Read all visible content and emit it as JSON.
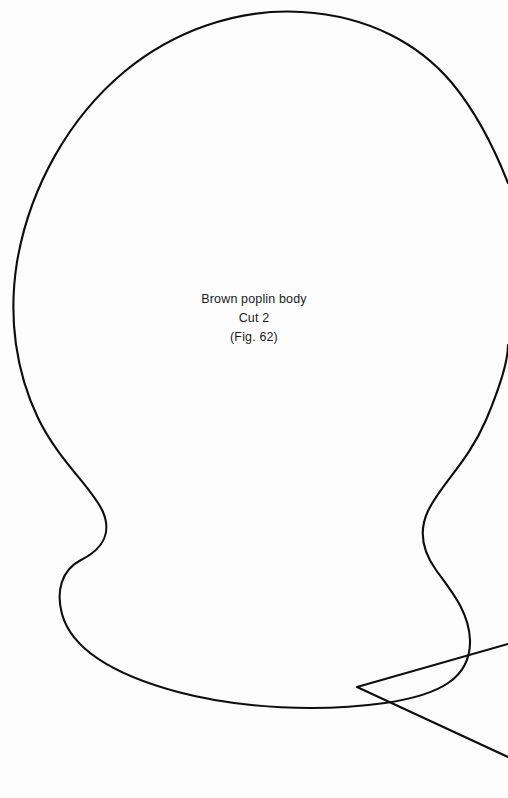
{
  "page": {
    "background_color": "#fdfdfd",
    "width": 508,
    "height": 798,
    "document_type": "sewing pattern template sheet"
  },
  "label": {
    "line1": "Brown poplin body",
    "line2": "Cut 2",
    "line3": "(Fig. 62)",
    "text_color": "#1a1a1a",
    "align": "center"
  },
  "shapes": {
    "stroke_color": "#0d0d0d",
    "stroke_width": 2.1,
    "fill": "none",
    "body_piece": {
      "name": "brown-poplin-body-outline",
      "description": "Large rounded dome-topped body pattern piece with narrowed waist and wide rounded base; right portion extends past the right page edge.",
      "path": "M 508 183 C 495 150 476 112 452 83 C 420 45 370 16 302 12 C 236 8 172 32 124 72 C 70 117 30 186 17 262 C 8 318 16 372 38 418 C 60 463 92 487 103 512 C 111 531 105 548 81 560 C 61 570 56 592 62 614 C 72 650 115 675 178 692 C 242 709 320 712 385 703 C 440 695 471 678 470 640 C 469 612 452 592 436 570 C 421 549 419 530 428 511 C 441 484 468 462 486 420 C 502 382 508 360 508 345"
    },
    "wedge_piece": {
      "name": "secondary-pattern-wedge-outline",
      "description": "Partial V-shaped wedge pattern piece entering from the right edge at the lower portion of the page, apex pointing left.",
      "path": "M 508 644 L 357 687 L 508 757"
    }
  }
}
